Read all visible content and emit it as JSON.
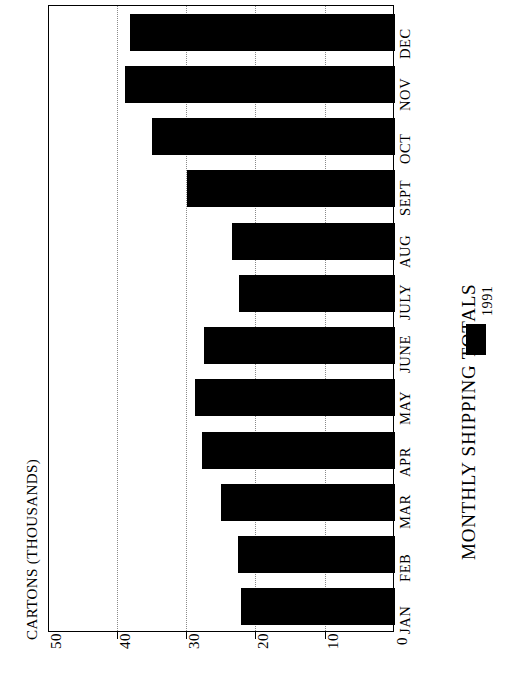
{
  "chart_data": {
    "type": "bar",
    "orientation": "horizontal-rotated",
    "title": "MONTHLY SHIPPING TOTALS",
    "xlabel": "",
    "ylabel": "CARTONS (THOUSANDS)",
    "categories": [
      "JAN",
      "FEB",
      "MAR",
      "APR",
      "MAY",
      "JUNE",
      "JULY",
      "AUG",
      "SEPT",
      "OCT",
      "NOV",
      "DEC"
    ],
    "values": [
      22.2,
      22.7,
      25.1,
      27.9,
      28.9,
      27.6,
      22.5,
      23.5,
      30.0,
      35.0,
      39.0,
      38.2
    ],
    "series": [
      {
        "name": "1991",
        "color": "#000000",
        "values": [
          22.2,
          22.7,
          25.1,
          27.9,
          28.9,
          27.6,
          22.5,
          23.5,
          30.0,
          35.0,
          39.0,
          38.2
        ]
      }
    ],
    "value_axis": {
      "ticks": [
        0,
        10,
        20,
        30,
        40,
        50
      ],
      "tick_labels": [
        "0",
        "10",
        "20",
        "30",
        "40",
        "50"
      ],
      "range": [
        0,
        50
      ]
    },
    "grid": "vertical-dotted",
    "legend": {
      "position": "right",
      "entries": [
        {
          "label": "1991",
          "color": "#000000"
        }
      ]
    }
  },
  "axis": {
    "title": "CARTONS (THOUSANDS)",
    "tick_labels": [
      "0",
      "10",
      "20",
      "30",
      "40",
      "50"
    ]
  },
  "title": {
    "text": "MONTHLY SHIPPING TOTALS"
  },
  "legend": {
    "label": "1991"
  },
  "months": {
    "jan": "JAN",
    "feb": "FEB",
    "mar": "MAR",
    "apr": "APR",
    "may": "MAY",
    "june": "JUNE",
    "july": "JULY",
    "aug": "AUG",
    "sept": "SEPT",
    "oct": "OCT",
    "nov": "NOV",
    "dec": "DEC"
  },
  "colors": {
    "bar": "#000000",
    "grid": "#8a8a8a",
    "frame": "#000000"
  }
}
